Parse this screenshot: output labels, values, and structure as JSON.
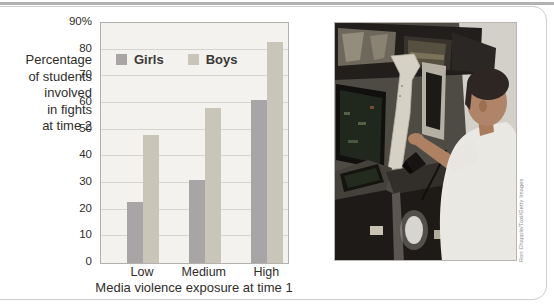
{
  "figure": {
    "photo": {
      "credit": "Ron Chapple/Taxi/Getty Images",
      "description": "Boy in a white shirt playing an arcade video game among dark arcade cabinets"
    },
    "colors": {
      "girls_bar": "#a8a5a7",
      "boys_bar": "#c9c5b9",
      "plot_bg": "#f3f2ef",
      "gridline": "#d6d4d0",
      "plot_border": "#b3b1ad",
      "text": "#2f2d2a",
      "frame_border": "#cdcdcd",
      "top_rule": "#b2b2b2"
    }
  },
  "chart_data": {
    "type": "bar",
    "categories": [
      "Low",
      "Medium",
      "High"
    ],
    "series": [
      {
        "name": "Girls",
        "color": "#a8a5a7",
        "values": [
          23,
          31,
          61
        ]
      },
      {
        "name": "Boys",
        "color": "#c9c5b9",
        "values": [
          48,
          58,
          83
        ]
      }
    ],
    "title": "",
    "xlabel": "Media violence exposure at time 1",
    "ylabel": "Percentage of students involved in fights at time 2",
    "ylabel_lines": [
      "Percentage",
      "of students",
      "involved",
      "in fights",
      "at time 2"
    ],
    "ylim": [
      0,
      90
    ],
    "yticks": [
      {
        "value": 90,
        "label": "90%"
      },
      {
        "value": 80,
        "label": "80"
      },
      {
        "value": 70,
        "label": "70"
      },
      {
        "value": 60,
        "label": "60"
      },
      {
        "value": 50,
        "label": "50"
      },
      {
        "value": 40,
        "label": "40"
      },
      {
        "value": 30,
        "label": "30"
      },
      {
        "value": 20,
        "label": "20"
      },
      {
        "value": 10,
        "label": "10"
      },
      {
        "value": 0,
        "label": "0"
      }
    ],
    "grid": true,
    "legend_position": "top-left-inside"
  }
}
